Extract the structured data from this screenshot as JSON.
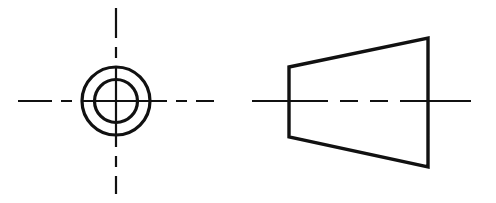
{
  "document": {
    "title": "Orthographic Engineering Drawing",
    "sheet_width": 496,
    "sheet_height": 203,
    "background_color": "#ffffff",
    "line_color": "#111111",
    "projection": "two-view orthographic"
  },
  "views": {
    "front_view": {
      "name": "front-view-concentric-circles",
      "description": "End view of truncated cone showing two concentric circles with crosshair centerlines",
      "center_x": 116,
      "center_y": 101,
      "outer_circle": {
        "name": "outer-circle",
        "radius": 34,
        "stroke_width": 3.2
      },
      "inner_circle": {
        "name": "inner-circle",
        "radius": 21.5,
        "stroke_width": 3.2
      },
      "horizontal_centerline": {
        "name": "horizontal-centerline",
        "y": 101,
        "x_start": 18,
        "x_end": 214,
        "stroke_width": 2.2,
        "dash_pattern": "34 9 11 9 86 9 11 9 34"
      },
      "vertical_centerline": {
        "name": "vertical-centerline",
        "x": 116,
        "y_start": 8,
        "y_end": 194,
        "stroke_width": 2.2,
        "dash_pattern": "30 9 11 9 80 9 11 9 30"
      }
    },
    "side_view": {
      "name": "side-view-trapezoid",
      "description": "Side profile of truncated cone drawn as a trapezoid with axis centerline",
      "stroke_width": 3.4,
      "vertices": {
        "top_left": {
          "x": 289,
          "y": 67
        },
        "top_right": {
          "x": 428,
          "y": 38
        },
        "bottom_right": {
          "x": 428,
          "y": 167
        },
        "bottom_left": {
          "x": 289,
          "y": 137
        }
      },
      "left_edge_height": 70,
      "right_edge_height": 129,
      "axis_centerline": {
        "name": "axis-centerline",
        "y": 101,
        "x_start": 252,
        "x_end": 471,
        "stroke_width": 2.2,
        "dash_pattern": "76 12 18 12 18 12 71"
      }
    }
  }
}
